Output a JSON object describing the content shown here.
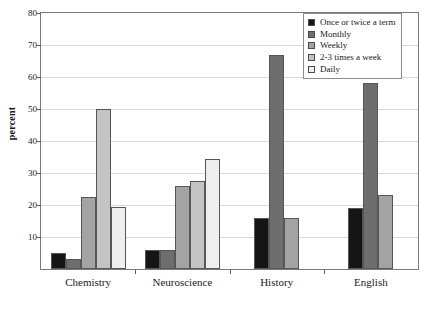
{
  "chart_data": {
    "type": "bar",
    "title": "",
    "xlabel": "",
    "ylabel": "percent",
    "ylim": [
      0,
      80
    ],
    "ytick_step": 10,
    "yticks": [
      0,
      10,
      20,
      30,
      40,
      50,
      60,
      70,
      80
    ],
    "grid": true,
    "legend_position": "top-right",
    "categories": [
      "Chemistry",
      "Neuroscience",
      "History",
      "English"
    ],
    "series": [
      {
        "name": "Once or twice a term",
        "color": "#151515",
        "values": [
          5,
          6,
          16,
          19
        ]
      },
      {
        "name": "Monthly",
        "color": "#6e6e6e",
        "values": [
          3,
          6,
          67,
          58
        ]
      },
      {
        "name": "Weekly",
        "color": "#a3a3a3",
        "values": [
          22.5,
          26,
          16,
          23
        ]
      },
      {
        "name": "2-3 times a week",
        "color": "#c4c4c4",
        "values": [
          50,
          27.5,
          null,
          null
        ]
      },
      {
        "name": "Daily",
        "color": "#eeeeee",
        "values": [
          19.5,
          34.5,
          null,
          null
        ]
      }
    ]
  }
}
